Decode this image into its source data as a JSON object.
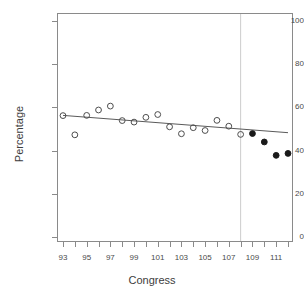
{
  "chart_data": {
    "type": "scatter",
    "title": "",
    "xlabel": "Congress",
    "ylabel": "Percentage",
    "xlim": [
      92.2,
      112.8
    ],
    "ylim": [
      0,
      104
    ],
    "grid": false,
    "legend": null,
    "yticks": [
      0,
      20,
      40,
      60,
      80,
      100
    ],
    "xticks": [
      93,
      94,
      95,
      96,
      97,
      98,
      99,
      100,
      101,
      102,
      103,
      104,
      105,
      106,
      107,
      108,
      109,
      110,
      111,
      112
    ],
    "xticklabels": [
      "93",
      "",
      "95",
      "",
      "97",
      "",
      "99",
      "",
      "101",
      "",
      "103",
      "",
      "105",
      "",
      "107",
      "",
      "109",
      "",
      "111",
      ""
    ],
    "xticklabels_shown": [
      "93",
      "95",
      "97",
      "99",
      "101",
      "103",
      "105",
      "107",
      "109",
      "111"
    ],
    "series": [
      {
        "name": "observed-open",
        "marker": "open-circle",
        "color": "#4d4d4d",
        "x": [
          93,
          94,
          95,
          96,
          97,
          98,
          99,
          100,
          101,
          102,
          103,
          104,
          105,
          106,
          107,
          108
        ],
        "y": [
          56.2,
          47.3,
          56.3,
          58.8,
          60.6,
          53.9,
          53.2,
          55.4,
          56.7,
          51.0,
          47.8,
          50.6,
          49.3,
          54.0,
          51.3,
          47.5
        ]
      },
      {
        "name": "projected-filled",
        "marker": "filled-circle",
        "color": "#1a1a1a",
        "x": [
          109,
          110,
          111,
          112
        ],
        "y": [
          47.9,
          44.0,
          37.8,
          38.7
        ]
      }
    ],
    "trend_line": {
      "name": "regression-line",
      "color": "#5a5a5a",
      "x_start": 93,
      "y_start": 56.3,
      "x_end": 112,
      "y_end": 48.3
    },
    "reference_line": {
      "name": "vertical-reference-line",
      "orientation": "vertical",
      "x": 108,
      "color": "#cccccc"
    }
  }
}
